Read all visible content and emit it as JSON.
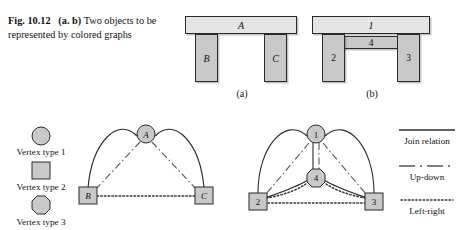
{
  "caption": {
    "figure_number": "Fig. 10.12",
    "panel_tag": "(a. b)",
    "text": "Two objects to be represented by colored graphs",
    "full": "Fig. 10.12  (a. b) Two objects to be represented by colored graphs"
  },
  "objects": {
    "a": {
      "sublabel": "(a)",
      "parts": [
        {
          "id": "top-bar",
          "label": "A",
          "shade": "light"
        },
        {
          "id": "left-leg",
          "label": "B",
          "shade": "mid"
        },
        {
          "id": "right-leg",
          "label": "C",
          "shade": "mid"
        }
      ]
    },
    "b": {
      "sublabel": "(b)",
      "parts": [
        {
          "id": "top-bar",
          "label": "1",
          "shade": "light"
        },
        {
          "id": "middle-bar",
          "label": "4",
          "shade": "mid"
        },
        {
          "id": "left-leg",
          "label": "2",
          "shade": "mid"
        },
        {
          "id": "right-leg",
          "label": "3",
          "shade": "mid"
        }
      ]
    }
  },
  "vertex_legend": {
    "items": [
      {
        "shape": "circle",
        "label": "Vertex type 1"
      },
      {
        "shape": "square",
        "label": "Vertex type 2"
      },
      {
        "shape": "octagon",
        "label": "Vertex type 3"
      }
    ]
  },
  "edge_legend": {
    "items": [
      {
        "style": "solid",
        "label": "Join relation"
      },
      {
        "style": "dash-dot",
        "label": "Up-down"
      },
      {
        "style": "dotted",
        "label": "Left-right"
      }
    ]
  },
  "graphs": {
    "a": {
      "nodes": [
        {
          "id": "A",
          "label": "A",
          "shape": "circle",
          "x": 146,
          "y": 16
        },
        {
          "id": "B",
          "label": "B",
          "shape": "square",
          "x": 88,
          "y": 78
        },
        {
          "id": "C",
          "label": "C",
          "shape": "square",
          "x": 204,
          "y": 78
        }
      ],
      "edges": [
        {
          "from": "A",
          "to": "B",
          "relation": "Join relation",
          "style": "solid"
        },
        {
          "from": "A",
          "to": "C",
          "relation": "Join relation",
          "style": "solid"
        },
        {
          "from": "A",
          "to": "B",
          "relation": "Up-down",
          "style": "dash-dot"
        },
        {
          "from": "A",
          "to": "C",
          "relation": "Up-down",
          "style": "dash-dot"
        },
        {
          "from": "B",
          "to": "C",
          "relation": "Left-right",
          "style": "dotted"
        }
      ]
    },
    "b": {
      "nodes": [
        {
          "id": "1",
          "label": "1",
          "shape": "circle",
          "x": 316,
          "y": 16
        },
        {
          "id": "4",
          "label": "4",
          "shape": "octagon",
          "x": 316,
          "y": 60
        },
        {
          "id": "2",
          "label": "2",
          "shape": "square",
          "x": 258,
          "y": 83
        },
        {
          "id": "3",
          "label": "3",
          "shape": "square",
          "x": 374,
          "y": 83
        }
      ],
      "edges": [
        {
          "from": "1",
          "to": "2",
          "relation": "Join relation",
          "style": "solid"
        },
        {
          "from": "1",
          "to": "3",
          "relation": "Join relation",
          "style": "solid"
        },
        {
          "from": "1",
          "to": "4",
          "relation": "Join relation",
          "style": "solid"
        },
        {
          "from": "4",
          "to": "2",
          "relation": "Join relation",
          "style": "solid"
        },
        {
          "from": "4",
          "to": "3",
          "relation": "Join relation",
          "style": "solid"
        },
        {
          "from": "1",
          "to": "2",
          "relation": "Up-down",
          "style": "dash-dot"
        },
        {
          "from": "1",
          "to": "3",
          "relation": "Up-down",
          "style": "dash-dot"
        },
        {
          "from": "1",
          "to": "4",
          "relation": "Up-down",
          "style": "dash-dot"
        },
        {
          "from": "4",
          "to": "2",
          "relation": "Left-right",
          "style": "dotted"
        },
        {
          "from": "4",
          "to": "3",
          "relation": "Left-right",
          "style": "dotted"
        },
        {
          "from": "2",
          "to": "3",
          "relation": "Left-right",
          "style": "dotted"
        }
      ]
    }
  },
  "colors": {
    "node_fill": "#c9c9c9",
    "part_light": "#e4e4e4",
    "part_mid": "#c9c9c9",
    "stroke": "#2a2a2a",
    "text": "#111111"
  }
}
